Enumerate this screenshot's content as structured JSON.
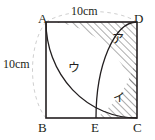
{
  "figure": {
    "shape": "square",
    "vertices": {
      "A": "A",
      "B": "B",
      "C": "C",
      "D": "D",
      "E": "E"
    },
    "dimensions": {
      "top": "10cm",
      "left": "10cm"
    },
    "regions": {
      "a": "ア",
      "i": "イ",
      "u": "ウ"
    },
    "colors": {
      "outline": "#231f20",
      "hatch": "#4a4a4a",
      "dashed_arc": "#b8b8b8",
      "background": "#ffffff",
      "text": "#231f20"
    }
  }
}
